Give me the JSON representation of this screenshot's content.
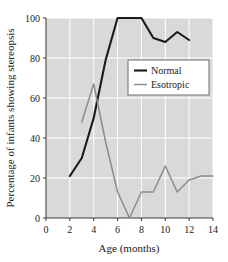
{
  "chart_data": {
    "type": "line",
    "title": "",
    "xlabel": "Age (months)",
    "ylabel": "Percentage of infants showing stereopsis",
    "xlim": [
      0,
      14
    ],
    "ylim": [
      0,
      100
    ],
    "xticks": [
      0,
      2,
      4,
      6,
      8,
      10,
      12,
      14
    ],
    "yticks": [
      0,
      20,
      40,
      60,
      80,
      100
    ],
    "xtick_labels": [
      "0",
      "2",
      "4",
      "6",
      "8",
      "10",
      "12",
      "14"
    ],
    "ytick_labels": [
      "0",
      "20",
      "40",
      "60",
      "80",
      "100"
    ],
    "grid": true,
    "grid_color": "#ffffff",
    "plot_background": "#d9d9d9",
    "legend_position": "upper-right-inside",
    "series": [
      {
        "name": "Normal",
        "color": "#1a1a1a",
        "line_width": 2.1,
        "x": [
          2,
          3,
          4,
          5,
          6,
          7,
          8,
          9,
          10,
          11,
          12
        ],
        "values": [
          21,
          30,
          50,
          79,
          100,
          100,
          100,
          90,
          88,
          93,
          89
        ]
      },
      {
        "name": "Esotropic",
        "color": "#8c8c8c",
        "line_width": 1.5,
        "x": [
          3,
          4,
          5,
          6,
          7,
          8,
          9,
          10,
          11,
          12,
          13,
          14
        ],
        "values": [
          48,
          67,
          38,
          13,
          0,
          13,
          13,
          26,
          13,
          19,
          21,
          21
        ]
      }
    ]
  },
  "legend": {
    "entries": [
      {
        "label": "Normal",
        "swatch_color": "#1a1a1a"
      },
      {
        "label": "Esotropic",
        "swatch_color": "#8c8c8c"
      }
    ]
  },
  "axes": {
    "x_title": "Age (months)",
    "y_title": "Percentage of infants showing stereopsis"
  }
}
